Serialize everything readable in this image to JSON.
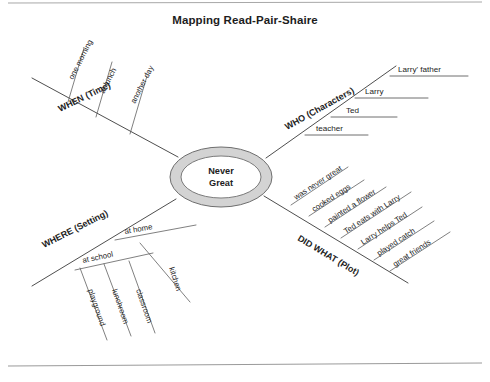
{
  "page": {
    "title": "Mapping Read-Pair-Shaire",
    "title_pos": {
      "x": 245,
      "y": 24
    },
    "background": "#ffffff",
    "ink_color": "#1d1d1d",
    "rule_color": "#9a9a9a",
    "top_rule": {
      "x1": 8,
      "y1": 3,
      "x2": 482,
      "y2": 2
    },
    "bottom_rule": {
      "x1": 8,
      "y1": 366,
      "x2": 482,
      "y2": 363
    }
  },
  "center": {
    "label_line1": "Never",
    "label_line2": "Great",
    "cx": 221,
    "cy": 177,
    "rx_outer": 51,
    "ry_outer": 30,
    "rx_inner": 40,
    "ry_inner": 21,
    "ring_color": "#d3d3d3",
    "ring_stroke": "#6e6e6e",
    "text_y1": 174,
    "text_y2": 186
  },
  "branches": [
    {
      "id": "when",
      "label": "WHEN (Time)",
      "label_x": 60,
      "label_y": 112,
      "label_rotate": -26,
      "line": {
        "x1": 178,
        "y1": 157,
        "x2": 32,
        "y2": 78
      },
      "subs": [
        {
          "text": "one morning",
          "text_x": 73,
          "text_y": 80,
          "rotate": -63,
          "line": {
            "x1": 68,
            "y1": 102,
            "x2": 84,
            "y2": 48
          }
        },
        {
          "text": "at lunch",
          "text_x": 104,
          "text_y": 94,
          "rotate": -63,
          "line": {
            "x1": 96,
            "y1": 117,
            "x2": 112,
            "y2": 62
          }
        },
        {
          "text": "another day",
          "text_x": 135,
          "text_y": 104,
          "rotate": -63,
          "line": {
            "x1": 130,
            "y1": 134,
            "x2": 147,
            "y2": 76
          }
        }
      ]
    },
    {
      "id": "who",
      "label": "WHO (Characters)",
      "label_x": 287,
      "label_y": 130,
      "label_rotate": -29,
      "line": {
        "x1": 266,
        "y1": 158,
        "x2": 396,
        "y2": 66
      },
      "subs": [
        {
          "text": "teacher",
          "text_x": 316,
          "text_y": 131,
          "rotate": 0,
          "line": {
            "x1": 305,
            "y1": 135,
            "x2": 368,
            "y2": 135
          }
        },
        {
          "text": "Ted",
          "text_x": 346,
          "text_y": 113,
          "rotate": 0,
          "line": {
            "x1": 331,
            "y1": 117,
            "x2": 397,
            "y2": 117
          }
        },
        {
          "text": "Larry",
          "text_x": 365,
          "text_y": 94,
          "rotate": 0,
          "line": {
            "x1": 355,
            "y1": 98,
            "x2": 428,
            "y2": 98
          }
        },
        {
          "text": "Larry' father",
          "text_x": 398,
          "text_y": 72,
          "rotate": 0,
          "line": {
            "x1": 390,
            "y1": 76,
            "x2": 468,
            "y2": 76
          }
        }
      ]
    },
    {
      "id": "where",
      "label": "WHERE (Setting)",
      "label_x": 44,
      "label_y": 248,
      "label_rotate": -27,
      "line": {
        "x1": 176,
        "y1": 199,
        "x2": 32,
        "y2": 286
      },
      "subs": [
        {
          "text": "at home",
          "text_x": 125,
          "text_y": 234,
          "rotate": -10,
          "line": {
            "x1": 115,
            "y1": 240,
            "x2": 196,
            "y2": 225
          }
        },
        {
          "text": "kitchen",
          "text_x": 169,
          "text_y": 268,
          "rotate": 72,
          "line": {
            "x1": 140,
            "y1": 243,
            "x2": 190,
            "y2": 302
          }
        },
        {
          "text": "at school",
          "text_x": 83,
          "text_y": 263,
          "rotate": -12,
          "line": {
            "x1": 75,
            "y1": 270,
            "x2": 153,
            "y2": 253
          }
        },
        {
          "text": "playground",
          "text_x": 88,
          "text_y": 290,
          "rotate": 71,
          "line": {
            "x1": 80,
            "y1": 268,
            "x2": 107,
            "y2": 340
          }
        },
        {
          "text": "lunchroom",
          "text_x": 112,
          "text_y": 290,
          "rotate": 71,
          "line": {
            "x1": 104,
            "y1": 264,
            "x2": 131,
            "y2": 336
          }
        },
        {
          "text": "classroom",
          "text_x": 136,
          "text_y": 290,
          "rotate": 71,
          "line": {
            "x1": 129,
            "y1": 261,
            "x2": 155,
            "y2": 333
          }
        }
      ]
    },
    {
      "id": "did-what",
      "label": "DID WHAT (Plot)",
      "label_x": 297,
      "label_y": 240,
      "label_rotate": 31,
      "line": {
        "x1": 264,
        "y1": 196,
        "x2": 408,
        "y2": 283
      },
      "subs": [
        {
          "text": "was never great",
          "text_x": 296,
          "text_y": 200,
          "rotate": -33,
          "line": {
            "x1": 291,
            "y1": 205,
            "x2": 348,
            "y2": 167
          }
        },
        {
          "text": "cooked eggs",
          "text_x": 314,
          "text_y": 212,
          "rotate": -33,
          "line": {
            "x1": 309,
            "y1": 216,
            "x2": 364,
            "y2": 180
          }
        },
        {
          "text": "painted a flower",
          "text_x": 330,
          "text_y": 223,
          "rotate": -33,
          "line": {
            "x1": 325,
            "y1": 227,
            "x2": 386,
            "y2": 187
          }
        },
        {
          "text": "Ted eats with Larry",
          "text_x": 346,
          "text_y": 234,
          "rotate": -33,
          "line": {
            "x1": 341,
            "y1": 238,
            "x2": 411,
            "y2": 192
          }
        },
        {
          "text": "Larry helps Ted",
          "text_x": 363,
          "text_y": 245,
          "rotate": -33,
          "line": {
            "x1": 358,
            "y1": 249,
            "x2": 422,
            "y2": 207
          }
        },
        {
          "text": "played catch",
          "text_x": 379,
          "text_y": 256,
          "rotate": -33,
          "line": {
            "x1": 374,
            "y1": 260,
            "x2": 434,
            "y2": 221
          }
        },
        {
          "text": "great friends",
          "text_x": 395,
          "text_y": 267,
          "rotate": -33,
          "line": {
            "x1": 390,
            "y1": 271,
            "x2": 450,
            "y2": 232
          }
        }
      ]
    }
  ]
}
